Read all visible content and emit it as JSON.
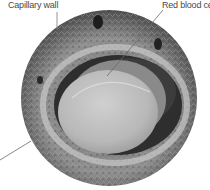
{
  "figure": {
    "labels": {
      "capillary_wall": "Capillary wall",
      "red_blood_cell": "Red blood cell"
    },
    "colors": {
      "background": "#ffffff",
      "label_text": "#4a4a4a",
      "leader_line": "#7a7a7a",
      "cell": "#bdbdbd",
      "lumen": "#2e2e2e",
      "tissue": "#8c8c8c"
    }
  }
}
